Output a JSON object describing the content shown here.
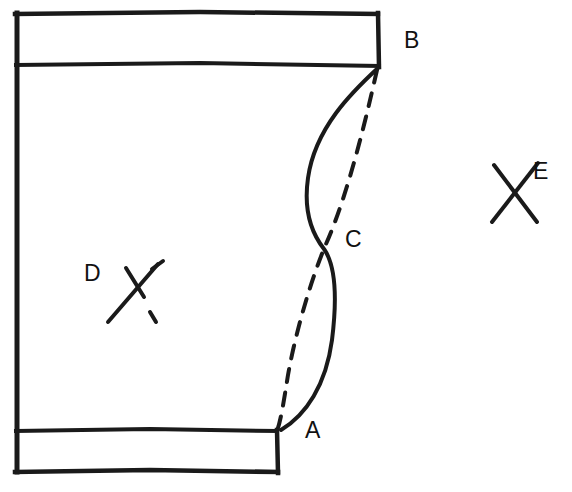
{
  "figure": {
    "background_color": "#ffffff",
    "ink_color": "#1a1a1a",
    "labels": [
      {
        "id": "A",
        "text": "A",
        "description": "lower junction point where solid and dashed curves meet at inner rectangle corner"
      },
      {
        "id": "B",
        "text": "B",
        "description": "upper junction point at top-right corner of upper band"
      },
      {
        "id": "C",
        "text": "C",
        "description": "crossing point of the solid curve and the dashed curve"
      },
      {
        "id": "D",
        "text": "D",
        "description": "cross marker inside the main enclosed region"
      },
      {
        "id": "E",
        "text": "E",
        "description": "cross marker outside the enclosed region to the right"
      }
    ],
    "markers": [
      {
        "id": "D",
        "shape": "x-cross",
        "center_x": 133,
        "center_y": 290
      },
      {
        "id": "E",
        "shape": "x-cross",
        "center_x": 516,
        "center_y": 193
      }
    ],
    "curves": [
      {
        "id": "solid-curve",
        "style": "solid",
        "from": "B",
        "to": "A",
        "note": "bows to the left above C, stays right below C"
      },
      {
        "id": "dashed-curve",
        "style": "dashed",
        "from": "B",
        "to": "A",
        "note": "nearly straight above C, bows to the left below C"
      }
    ],
    "frame": {
      "left_edge_x": 15,
      "top_edge_y": 13,
      "upper_band_bottom_y": 64,
      "lower_band_top_y": 430,
      "bottom_edge_y": 472,
      "upper_band_right_x": 378,
      "lower_band_right_x": 277
    }
  }
}
